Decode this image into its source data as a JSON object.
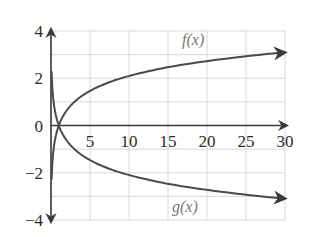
{
  "chart_data": {
    "type": "line",
    "title": "",
    "xlabel": "",
    "ylabel": "",
    "xlim": [
      0,
      30
    ],
    "ylim": [
      -4,
      4
    ],
    "grid": true,
    "x_ticks": [
      "5",
      "10",
      "15",
      "20",
      "25",
      "30"
    ],
    "y_ticks": [
      "4",
      "2",
      "0",
      "−2",
      "−4"
    ],
    "series": [
      {
        "name": "f(x)",
        "label": "f(x)",
        "x": [
          0.05,
          0.2,
          0.5,
          1,
          2,
          3,
          5,
          10,
          15,
          20,
          25,
          30
        ],
        "values": [
          -2.73,
          -1.46,
          -0.63,
          0,
          0.63,
          1.0,
          1.46,
          2.1,
          2.46,
          2.73,
          2.93,
          3.1
        ]
      },
      {
        "name": "g(x)",
        "label": "g(x)",
        "x": [
          0.05,
          0.2,
          0.5,
          1,
          2,
          3,
          5,
          10,
          15,
          20,
          25,
          30
        ],
        "values": [
          2.73,
          1.46,
          0.63,
          0,
          -0.63,
          -1.0,
          -1.46,
          -2.1,
          -2.46,
          -2.73,
          -2.93,
          -3.1
        ]
      }
    ],
    "annotations": [
      "f(x)",
      "g(x)"
    ]
  },
  "colors": {
    "curve": "#4a4a4a",
    "axis": "#3a3a3a",
    "grid": "#d8d8d8",
    "label": "#777777"
  }
}
